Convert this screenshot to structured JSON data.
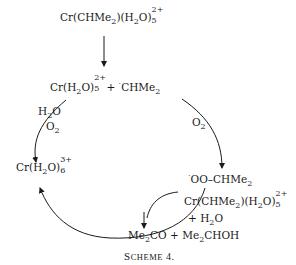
{
  "scheme": {
    "caption_first": "S",
    "caption_rest": "CHEME",
    "caption_num": " 4.",
    "species": {
      "start": {
        "main": "Cr(CHMe",
        "sub1": "2",
        "mid": ")(H",
        "sub2": "2",
        "o": "O)",
        "charge": "2+",
        "count": "5"
      },
      "homolysis": {
        "main": "Cr(H",
        "sub1": "2",
        "o": "O)",
        "charge": "2+",
        "count": "5",
        "plus": " + ",
        "radical": "·",
        "rest": "CHMe",
        "sub2": "2"
      },
      "chromium_product": {
        "main": "Cr(H",
        "sub1": "2",
        "o": "O)",
        "charge": "3+",
        "count": "6"
      },
      "peroxyl": {
        "radical": "·",
        "rest": "OO–CHMe",
        "sub": "2"
      },
      "co_reactant": {
        "main": "Cr(CHMe",
        "sub1": "2",
        "mid": ")(H",
        "sub2": "2",
        "o": "O)",
        "charge": "2+",
        "count": "5"
      },
      "co_reactant_water": {
        "plus": "+ H",
        "sub": "2",
        "o": "O"
      },
      "products": {
        "a": "Me",
        "a_sub": "2",
        "a_rest": "CO + Me",
        "b_sub": "2",
        "b_rest": "CHOH"
      }
    },
    "arrow_labels": {
      "left_h2o": {
        "main": "H",
        "sub": "2",
        "o": "O"
      },
      "left_o2": {
        "main": "O",
        "sub": "2"
      },
      "right_o2": {
        "main": "O",
        "sub": "2"
      }
    }
  }
}
